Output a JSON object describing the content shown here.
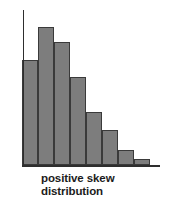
{
  "figure": {
    "caption_line1": "positive skew",
    "caption_line2": "distribution",
    "background_color": "#ffffff",
    "bar_fill_color": "#7d7d7d",
    "bar_stroke_color": "#3a3a3a",
    "axis_color": "#2e2e2e",
    "caption_color": "#1b1b1b"
  },
  "chart_data": {
    "type": "bar",
    "title": "positive skew distribution",
    "xlabel": "",
    "ylabel": "",
    "categories": [
      "1",
      "2",
      "3",
      "4",
      "5",
      "6",
      "7",
      "8"
    ],
    "values": [
      105,
      138,
      123,
      88,
      53,
      35,
      15,
      6
    ],
    "ylim": [
      0,
      155
    ],
    "grid": false,
    "legend": false,
    "axes_shown": [
      "x",
      "y"
    ],
    "tick_labels_shown": false,
    "annotations": [
      "positive skew distribution"
    ]
  },
  "geometry": {
    "plot_left": 22,
    "plot_baseline_y": 165,
    "baseline_right": 160,
    "y_axis_top": 10,
    "bar_width": 16,
    "bar_tops": [
      60,
      27,
      42,
      77,
      112,
      130,
      150,
      159
    ]
  }
}
